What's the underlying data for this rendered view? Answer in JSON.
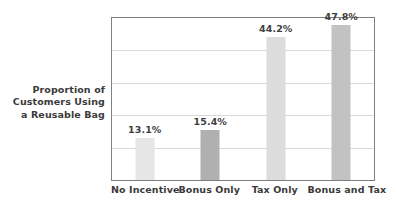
{
  "chart_data": {
    "type": "bar",
    "title": "",
    "subtitle": "",
    "xlabel": "",
    "ylabel": "Proportion of Customers Using a Reusable Bag",
    "ylabel_lines": [
      "Proportion of",
      "Customers Using",
      "a Reusable Bag"
    ],
    "categories": [
      "No Incentive",
      "Bonus Only",
      "Tax Only",
      "Bonus and Tax"
    ],
    "values": [
      13.1,
      15.4,
      44.2,
      47.8
    ],
    "value_labels": [
      "13.1%",
      "15.4%",
      "44.2%",
      "47.8%"
    ],
    "units": "percent",
    "ylim": [
      0,
      50
    ],
    "xlim_note": "categorical",
    "y_tick_labels": [],
    "gridlines": {
      "horizontal": true,
      "vertical": false,
      "count": 4,
      "color": "#d9d9d9"
    },
    "legend": {
      "visible": false,
      "position": "none",
      "entries": []
    },
    "bar_colors": [
      "#e6e6e6",
      "#b0b0b0",
      "#dcdcdc",
      "#c2c2c2"
    ],
    "annotations": []
  },
  "figure": {
    "background_color": "#ffffff",
    "plot_background_color": "#ffffff",
    "plot_border_color": "#808080",
    "text_color": "#3a3a3a"
  }
}
